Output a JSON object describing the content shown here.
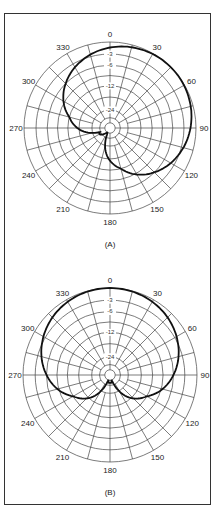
{
  "figure": {
    "panels": [
      {
        "id": "A",
        "caption": "(A)",
        "center": [
          110,
          128
        ],
        "radius": 86,
        "angle_labels": [
          "0",
          "30",
          "60",
          "90",
          "120",
          "150",
          "180",
          "210",
          "240",
          "270",
          "300",
          "330"
        ],
        "ring_labels": [
          "-3",
          "-6",
          "-12",
          "-24"
        ],
        "pattern": "cardioid-rotated-45"
      },
      {
        "id": "B",
        "caption": "(B)",
        "center": [
          110,
          375
        ],
        "radius": 87,
        "angle_labels": [
          "0",
          "30",
          "60",
          "90",
          "120",
          "150",
          "180",
          "210",
          "240",
          "270",
          "300",
          "330"
        ],
        "ring_labels": [
          "-3",
          "-6",
          "-12",
          "-24"
        ],
        "pattern": "cardioid-forward"
      }
    ],
    "colors": {
      "grid": "#444444",
      "pattern": "#111111",
      "frame": "#333333"
    }
  }
}
